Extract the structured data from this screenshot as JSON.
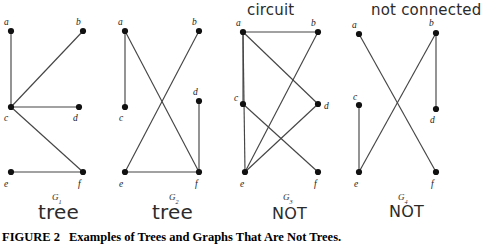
{
  "figure": {
    "label": "FIGURE 2",
    "caption": "Examples of Trees and Graphs That Are Not Trees."
  },
  "annotations": {
    "g3_top": "circuit",
    "g4_top": "not connected",
    "g1_verdict": "tree",
    "g2_verdict": "tree",
    "g3_verdict": "NOT",
    "g4_verdict": "NOT"
  },
  "graphs": [
    {
      "id": "G1",
      "name": "G",
      "subscript": "1",
      "name_x": 52,
      "name_y": 200,
      "vertices": [
        {
          "id": "a",
          "label": "a",
          "x": 11,
          "y": 31,
          "lx": 4,
          "ly": 25
        },
        {
          "id": "b",
          "label": "b",
          "x": 83,
          "y": 31,
          "lx": 76,
          "ly": 25
        },
        {
          "id": "c",
          "label": "c",
          "x": 11,
          "y": 107,
          "lx": 4,
          "ly": 121
        },
        {
          "id": "d",
          "label": "d",
          "x": 79,
          "y": 107,
          "lx": 73,
          "ly": 121
        },
        {
          "id": "e",
          "label": "e",
          "x": 11,
          "y": 172,
          "lx": 4,
          "ly": 187
        },
        {
          "id": "f",
          "label": "f",
          "x": 83,
          "y": 172,
          "lx": 78,
          "ly": 187
        }
      ],
      "edges": [
        [
          "a",
          "c"
        ],
        [
          "c",
          "b"
        ],
        [
          "c",
          "d"
        ],
        [
          "c",
          "f"
        ],
        [
          "e",
          "f"
        ]
      ]
    },
    {
      "id": "G2",
      "name": "G",
      "subscript": "2",
      "name_x": 169,
      "name_y": 200,
      "vertices": [
        {
          "id": "a",
          "label": "a",
          "x": 125,
          "y": 31,
          "lx": 118,
          "ly": 25
        },
        {
          "id": "b",
          "label": "b",
          "x": 199,
          "y": 31,
          "lx": 192,
          "ly": 25
        },
        {
          "id": "c",
          "label": "c",
          "x": 125,
          "y": 107,
          "lx": 119,
          "ly": 121
        },
        {
          "id": "d",
          "label": "d",
          "x": 199,
          "y": 101,
          "lx": 193,
          "ly": 95
        },
        {
          "id": "e",
          "label": "e",
          "x": 125,
          "y": 172,
          "lx": 119,
          "ly": 187
        },
        {
          "id": "f",
          "label": "f",
          "x": 199,
          "y": 172,
          "lx": 195,
          "ly": 187
        }
      ],
      "edges": [
        [
          "a",
          "c"
        ],
        [
          "a",
          "f"
        ],
        [
          "b",
          "e"
        ],
        [
          "d",
          "f"
        ],
        [
          "e",
          "f"
        ]
      ]
    },
    {
      "id": "G3",
      "name": "G",
      "subscript": "3",
      "name_x": 283,
      "name_y": 200,
      "vertices": [
        {
          "id": "a",
          "label": "a",
          "x": 243,
          "y": 32,
          "lx": 236,
          "ly": 26
        },
        {
          "id": "b",
          "label": "b",
          "x": 318,
          "y": 32,
          "lx": 311,
          "ly": 26
        },
        {
          "id": "c",
          "label": "c",
          "x": 243,
          "y": 104,
          "lx": 234,
          "ly": 101
        },
        {
          "id": "d",
          "label": "d",
          "x": 318,
          "y": 104,
          "lx": 324,
          "ly": 109
        },
        {
          "id": "e",
          "label": "e",
          "x": 245,
          "y": 172,
          "lx": 240,
          "ly": 187
        },
        {
          "id": "f",
          "label": "f",
          "x": 318,
          "y": 172,
          "lx": 314,
          "ly": 187
        }
      ],
      "edges": [
        [
          "a",
          "b"
        ],
        [
          "a",
          "c"
        ],
        [
          "a",
          "e"
        ],
        [
          "c",
          "f"
        ],
        [
          "b",
          "e"
        ],
        [
          "d",
          "e"
        ],
        [
          "a",
          "d"
        ]
      ]
    },
    {
      "id": "G4",
      "name": "G",
      "subscript": "4",
      "name_x": 398,
      "name_y": 200,
      "vertices": [
        {
          "id": "a",
          "label": "a",
          "x": 359,
          "y": 34,
          "lx": 352,
          "ly": 28
        },
        {
          "id": "b",
          "label": "b",
          "x": 436,
          "y": 33,
          "lx": 429,
          "ly": 26
        },
        {
          "id": "c",
          "label": "c",
          "x": 359,
          "y": 105,
          "lx": 353,
          "ly": 100
        },
        {
          "id": "d",
          "label": "d",
          "x": 436,
          "y": 109,
          "lx": 430,
          "ly": 123
        },
        {
          "id": "e",
          "label": "e",
          "x": 359,
          "y": 172,
          "lx": 354,
          "ly": 187
        },
        {
          "id": "f",
          "label": "f",
          "x": 436,
          "y": 172,
          "lx": 431,
          "ly": 187
        }
      ],
      "edges": [
        [
          "a",
          "f"
        ],
        [
          "b",
          "e"
        ],
        [
          "b",
          "d"
        ],
        [
          "c",
          "e"
        ]
      ]
    }
  ]
}
